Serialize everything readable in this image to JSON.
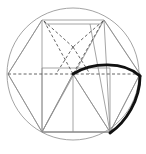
{
  "figure": {
    "canvas": {
      "width": 146,
      "height": 154,
      "background": "#ffffff"
    },
    "colors": {
      "thin_line": "#8d8d8d",
      "dashed_line": "#545454",
      "bold_curve": "#111111",
      "background": "#ffffff"
    },
    "circle": {
      "label": "circumscribing-circle",
      "cx": 73,
      "cy": 74,
      "r": 66,
      "style": "thin"
    },
    "horizontal_diameter": {
      "label": "horizontal-dashed-diameter",
      "x1": 8,
      "y1": 74,
      "x2": 140,
      "y2": 74,
      "style": "dashed"
    },
    "hexagon": {
      "label": "inscribed-hexagon",
      "points": "42,20 104,20 140,74 110,132 42,132 8,74",
      "style": "thin"
    },
    "pentagon_top_edge": {
      "label": "pentagon-top-edge",
      "x1": 45,
      "y1": 24,
      "x2": 101,
      "y2": 24,
      "style": "thin"
    },
    "pentagram": {
      "label": "dashed-pentagram-lines",
      "segments": [
        {
          "name": "left-upper-to-center",
          "x1": 44,
          "y1": 21,
          "x2": 73,
          "y2": 74
        },
        {
          "name": "right-upper-to-center",
          "x1": 103,
          "y1": 21,
          "x2": 73,
          "y2": 74
        },
        {
          "name": "left-upper-to-apex",
          "x1": 44,
          "y1": 21,
          "x2": 73,
          "y2": 47
        },
        {
          "name": "right-upper-to-apex",
          "x1": 103,
          "y1": 21,
          "x2": 73,
          "y2": 47
        },
        {
          "name": "apex-down-left",
          "x1": 73,
          "y1": 47,
          "x2": 56,
          "y2": 74
        },
        {
          "name": "apex-down-right",
          "x1": 73,
          "y1": 47,
          "x2": 90,
          "y2": 74
        }
      ],
      "style": "dashed"
    },
    "square": {
      "label": "inscribed-square",
      "points": "42,68 110,68 110,132 42,132",
      "style": "thin"
    },
    "triangle": {
      "label": "inscribed-triangle",
      "points": "73,74 42,132 110,132",
      "style": "thin"
    },
    "radiating_lines": {
      "label": "radiating-construction-lines",
      "segments": [
        {
          "name": "center-to-bottom-left",
          "x1": 73,
          "y1": 74,
          "x2": 42,
          "y2": 132
        },
        {
          "name": "center-to-bottom-right",
          "x1": 73,
          "y1": 74,
          "x2": 110,
          "y2": 132
        },
        {
          "name": "center-to-bottom",
          "x1": 73,
          "y1": 74,
          "x2": 73,
          "y2": 132
        },
        {
          "name": "bottom-left-to-upper-left",
          "x1": 42,
          "y1": 132,
          "x2": 42,
          "y2": 20
        },
        {
          "name": "bottom-left-to-left-vertex",
          "x1": 42,
          "y1": 132,
          "x2": 8,
          "y2": 74
        },
        {
          "name": "bottom-left-to-upper-right",
          "x1": 42,
          "y1": 132,
          "x2": 104,
          "y2": 20
        },
        {
          "name": "bottom-right-to-right-vertex",
          "x1": 110,
          "y1": 132,
          "x2": 140,
          "y2": 74
        },
        {
          "name": "bottom-right-to-upper-right",
          "x1": 110,
          "y1": 132,
          "x2": 104,
          "y2": 20
        },
        {
          "name": "bottom-right-to-top-mid",
          "x1": 110,
          "y1": 132,
          "x2": 90,
          "y2": 24
        },
        {
          "name": "left-vertex-to-upper-left",
          "x1": 8,
          "y1": 74,
          "x2": 42,
          "y2": 20
        },
        {
          "name": "right-vertex-to-upper-right",
          "x1": 140,
          "y1": 74,
          "x2": 104,
          "y2": 20
        }
      ],
      "style": "thin"
    },
    "bold_lens": {
      "label": "bold-lens-arc",
      "description": "Thick black leaf shape from circle centre, arcing right to the circle's right vertex, then curving down to the lower-right square corner",
      "upper_arc": "M 73,74 C 92,62 124,61 140,76",
      "lower_arc": "M 140,76 C 140,100 126,122 110,133",
      "style": "bold-curve",
      "stroke_width": 2.9
    }
  }
}
